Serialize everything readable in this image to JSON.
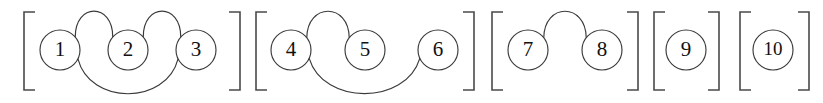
{
  "diagram": {
    "type": "block-arc-diagram",
    "canvas": {
      "width": 823,
      "height": 103,
      "background": "#ffffff"
    },
    "colors": {
      "node_stroke": "#3a3a3a",
      "node_fill": "#ffffff",
      "arc_stroke": "#3a3a3a",
      "bracket_stroke": "#4a4a4a",
      "label_color": "#111111"
    },
    "node_radius": 20,
    "node_center_y": 50,
    "blocks": [
      {
        "id": "block-1",
        "bracket": {
          "left": 24,
          "right": 240,
          "top": 12,
          "bottom": 90,
          "tick": 11
        },
        "nodes": [
          {
            "id": "node-1",
            "label": "1",
            "cx": 60,
            "cy": 50
          },
          {
            "id": "node-2",
            "label": "2",
            "cx": 128,
            "cy": 50
          },
          {
            "id": "node-3",
            "label": "3",
            "cx": 196,
            "cy": 50
          }
        ],
        "arcs": [
          {
            "id": "arc-1-2",
            "from": "1",
            "to": "2",
            "side": "top",
            "height": 36
          },
          {
            "id": "arc-2-3",
            "from": "2",
            "to": "3",
            "side": "top",
            "height": 36
          },
          {
            "id": "arc-1-3",
            "from": "1",
            "to": "3",
            "side": "bottom",
            "height": 42
          }
        ]
      },
      {
        "id": "block-2",
        "bracket": {
          "left": 256,
          "right": 474,
          "top": 12,
          "bottom": 90,
          "tick": 11
        },
        "nodes": [
          {
            "id": "node-4",
            "label": "4",
            "cx": 291,
            "cy": 50
          },
          {
            "id": "node-5",
            "label": "5",
            "cx": 365,
            "cy": 50
          },
          {
            "id": "node-6",
            "label": "6",
            "cx": 438,
            "cy": 50
          }
        ],
        "arcs": [
          {
            "id": "arc-4-5",
            "from": "4",
            "to": "5",
            "side": "top",
            "height": 36
          },
          {
            "id": "arc-4-6",
            "from": "4",
            "to": "6",
            "side": "bottom",
            "height": 42
          }
        ]
      },
      {
        "id": "block-3",
        "bracket": {
          "left": 492,
          "right": 638,
          "top": 12,
          "bottom": 90,
          "tick": 11
        },
        "nodes": [
          {
            "id": "node-7",
            "label": "7",
            "cx": 528,
            "cy": 50
          },
          {
            "id": "node-8",
            "label": "8",
            "cx": 602,
            "cy": 50
          }
        ],
        "arcs": [
          {
            "id": "arc-7-8",
            "from": "7",
            "to": "8",
            "side": "top",
            "height": 36
          }
        ]
      },
      {
        "id": "block-4",
        "bracket": {
          "left": 654,
          "right": 719,
          "top": 12,
          "bottom": 90,
          "tick": 11
        },
        "nodes": [
          {
            "id": "node-9",
            "label": "9",
            "cx": 686,
            "cy": 50
          }
        ],
        "arcs": []
      },
      {
        "id": "block-5",
        "bracket": {
          "left": 740,
          "right": 809,
          "top": 12,
          "bottom": 90,
          "tick": 11
        },
        "nodes": [
          {
            "id": "node-10",
            "label": "10",
            "cx": 773,
            "cy": 50
          }
        ],
        "arcs": []
      }
    ]
  }
}
